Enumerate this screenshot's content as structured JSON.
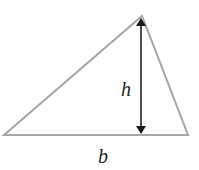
{
  "diagram": {
    "labels": {
      "height": "h",
      "base": "b"
    },
    "colors": {
      "triangle_stroke": "#a6a6a6",
      "arrow": "#1a1a1a",
      "text": "#222222",
      "background": "#ffffff"
    },
    "vertices": [
      [
        4,
        135
      ],
      [
        142,
        16
      ],
      [
        188,
        135
      ]
    ],
    "height_line": {
      "x": 141,
      "y_top": 17,
      "y_bottom": 134
    }
  }
}
